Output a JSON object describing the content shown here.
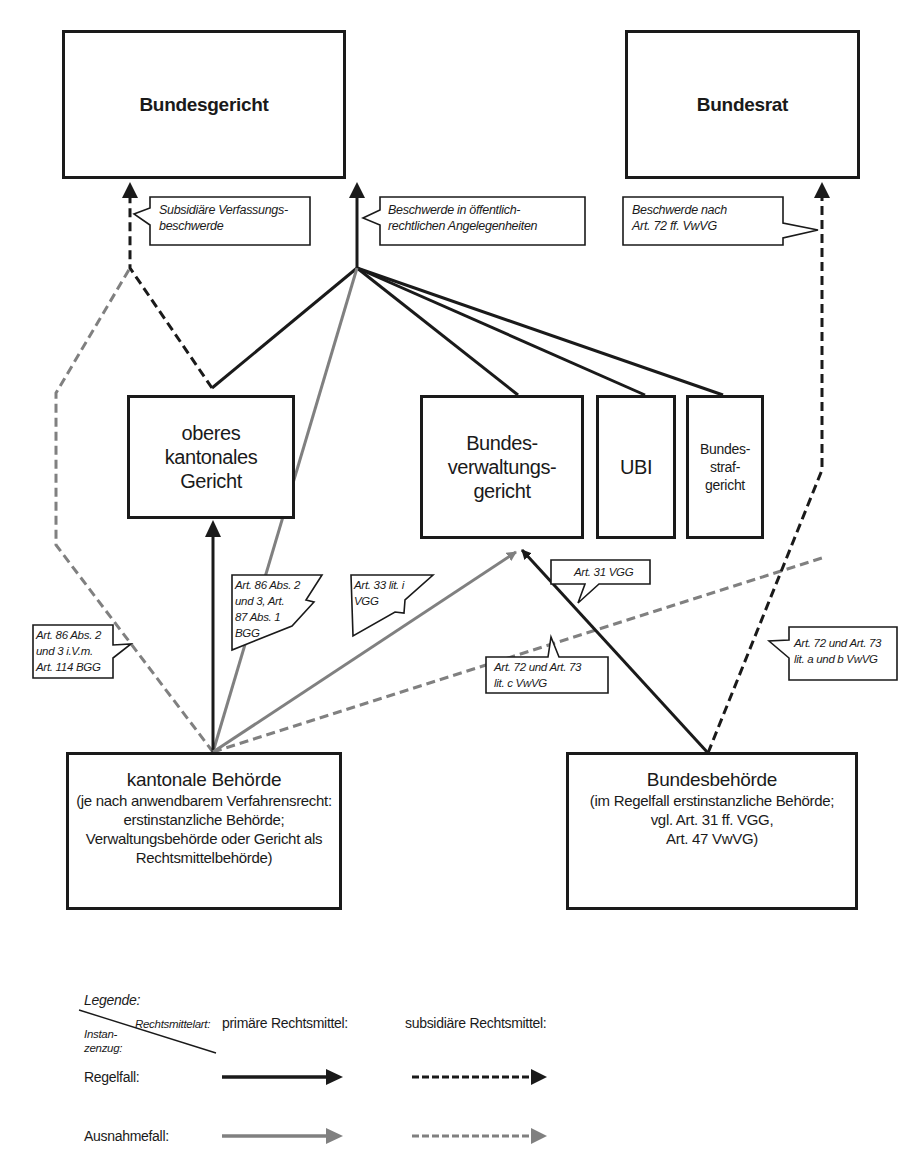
{
  "colors": {
    "primary": "#1a1a1a",
    "exception": "#808080"
  },
  "nodes": {
    "bundesgericht": "Bundesgericht",
    "bundesrat": "Bundesrat",
    "oberes_kantonales_gericht": [
      "oberes",
      "kantonales",
      "Gericht"
    ],
    "bundesverwaltungsgericht": [
      "Bundes-",
      "verwaltungs-",
      "gericht"
    ],
    "ubi": "UBI",
    "bundesstrafgericht": [
      "Bundes-",
      "straf-",
      "gericht"
    ],
    "kantonale_behoerde": {
      "title": "kantonale Behörde",
      "lines": [
        "(je nach anwendbarem Verfahrensrecht:",
        "erstinstanzliche Behörde;",
        "Verwaltungsbehörde oder Gericht als",
        "Rechtsmittelbehörde)"
      ]
    },
    "bundesbehoerde": {
      "title": "Bundesbehörde",
      "lines": [
        "(im Regelfall erstinstanzliche Behörde;",
        "vgl. Art. 31 ff. VGG,",
        "Art. 47 VwVG)"
      ]
    }
  },
  "callouts": {
    "subsidiaere": "Subsidiäre Verfassungs-\nbeschwerde",
    "oeffentlich": "Beschwerde in öffentlich-\nrechtlichen Angelegenheiten",
    "bundesrat": "Beschwerde nach\nArt. 72 ff. VwVG",
    "art86_114": "Art. 86 Abs. 2\nund 3 i.V.m.\nArt. 114 BGG",
    "art86_87": "Art. 86 Abs. 2\nund 3, Art.\n87 Abs. 1\nBGG",
    "art33": "Art. 33 lit. i\nVGG",
    "art31": "Art. 31 VGG",
    "art72_c": "Art. 72 und Art. 73\nlit. c VwVG",
    "art72_ab": "Art. 72 und Art. 73\nlit. a und b VwVG"
  },
  "legend": {
    "title": "Legende:",
    "col_header_type": "Rechtsmittelart:",
    "row_header": "Instan-\nzenzug:",
    "col_primary": "primäre Rechtsmittel:",
    "col_subsidiary": "subsidiäre Rechtsmittel:",
    "row_regular": "Regelfall:",
    "row_exception": "Ausnahmefall:"
  }
}
